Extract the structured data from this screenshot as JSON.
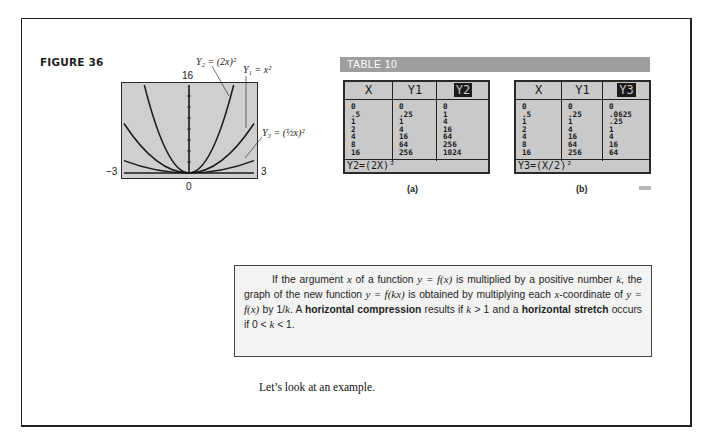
{
  "figure": {
    "label": "FIGURE 36",
    "graph": {
      "y_max_label": "16",
      "x_min_label": "−3",
      "x_max_label": "3",
      "origin_label": "0",
      "labels": {
        "y2": "Y₂ = (2x)²",
        "y1": "Y₁ = x²",
        "y3": "Y₃ = (½x)²"
      }
    }
  },
  "table": {
    "title": "TABLE 10",
    "a": {
      "caption": "(a)",
      "headers": [
        "X",
        "Y1",
        "Y2"
      ],
      "columns": [
        [
          "0",
          ".5",
          "1",
          "2",
          "4",
          "8",
          "16"
        ],
        [
          "0",
          ".25",
          "1",
          "4",
          "16",
          "64",
          "256"
        ],
        [
          "0",
          "1",
          "4",
          "16",
          "64",
          "256",
          "1024"
        ]
      ],
      "formula": "Y2=(2X)²"
    },
    "b": {
      "caption": "(b)",
      "headers": [
        "X",
        "Y1",
        "Y3"
      ],
      "columns": [
        [
          "0",
          ".5",
          "1",
          "2",
          "4",
          "8",
          "16"
        ],
        [
          "0",
          ".25",
          "1",
          "4",
          "16",
          "64",
          "256"
        ],
        [
          "0",
          ".0625",
          ".25",
          "1",
          "4",
          "16",
          "64"
        ]
      ],
      "formula": "Y3=(X/2)²"
    }
  },
  "rule_box": {
    "p1": "If the argument ",
    "x": "x",
    "p2": " of a function ",
    "eq1": "y = f(x)",
    "p3": " is multiplied by a positive number ",
    "k": "k",
    "p4": ", the graph of the new function ",
    "eq2": "y = f(kx)",
    "p5": " is obtained by multiplying each ",
    "x2": "x",
    "p6": "-coordinate of ",
    "eq3": "y = f(x)",
    "p7": " by 1/",
    "k2": "k",
    "p8": ". A ",
    "bold1": "horizontal compression",
    "p9": " results if ",
    "cond1": "k",
    "p10": " > 1 and a ",
    "bold2": "horizontal stretch",
    "p11": " occurs if 0 < ",
    "cond2": "k",
    "p12": " < 1."
  },
  "example_text": "Let’s look at an example."
}
